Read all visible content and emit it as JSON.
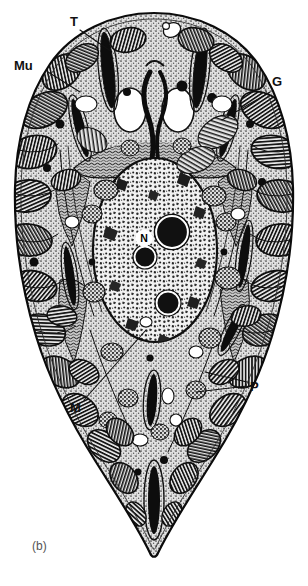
{
  "figure": {
    "kind": "electron-micrograph-line-drawing",
    "caption": "(b)",
    "background_color": "#ffffff",
    "ink_color": "#111111",
    "cytoplasm_tone": "#d9d9d9",
    "nucleoplasm_tone": "#efefef",
    "width": 308,
    "height": 586
  },
  "labels": [
    {
      "id": "T",
      "text": "T",
      "x": 70,
      "y": 26,
      "anchor": "start",
      "leader": [
        [
          80,
          30
        ],
        [
          112,
          52
        ]
      ]
    },
    {
      "id": "Mu",
      "text": "Mu",
      "x": 14,
      "y": 70,
      "anchor": "start",
      "leader": [
        [
          48,
          72
        ],
        [
          78,
          90
        ]
      ]
    },
    {
      "id": "G",
      "text": "G",
      "x": 272,
      "y": 86,
      "anchor": "start",
      "leader": [
        [
          270,
          92
        ],
        [
          222,
          120
        ]
      ]
    },
    {
      "id": "N",
      "text": "N",
      "x": 144,
      "y": 212,
      "anchor": "middle",
      "leader": []
    },
    {
      "id": "M",
      "text": "M",
      "x": 70,
      "y": 404,
      "anchor": "start",
      "leader": [
        [
          84,
          400
        ],
        [
          146,
          330
        ]
      ]
    },
    {
      "id": "P",
      "text": "P",
      "x": 250,
      "y": 387,
      "anchor": "start",
      "leader": [
        [
          247,
          382
        ],
        [
          205,
          372
        ]
      ]
    },
    {
      "id": "P2",
      "text": "",
      "x": 0,
      "y": 0,
      "anchor": "start",
      "leader": [
        [
          247,
          384
        ],
        [
          196,
          388
        ]
      ]
    }
  ],
  "label_legend": {
    "T": "trichocyst / rhoptry",
    "Mu": "mucocyst",
    "G": "Golgi",
    "N": "nucleus",
    "M": "mitochondrion",
    "P": "paraglycogen / plastid"
  },
  "structures": {
    "nucleus": {
      "cx": 155,
      "cy": 250,
      "rx": 62,
      "ry": 92
    },
    "nucleoli": [
      {
        "cx": 172,
        "cy": 232,
        "r": 15
      },
      {
        "cx": 146,
        "cy": 256,
        "r": 10
      },
      {
        "cx": 168,
        "cy": 302,
        "r": 11
      }
    ],
    "apical_vacuoles": [
      {
        "cx": 130,
        "cy": 108,
        "rx": 16,
        "ry": 21
      },
      {
        "cx": 174,
        "cy": 108,
        "rx": 16,
        "ry": 21
      }
    ],
    "peripheral_organelle_count": 44,
    "trichocyst_count": 8
  }
}
